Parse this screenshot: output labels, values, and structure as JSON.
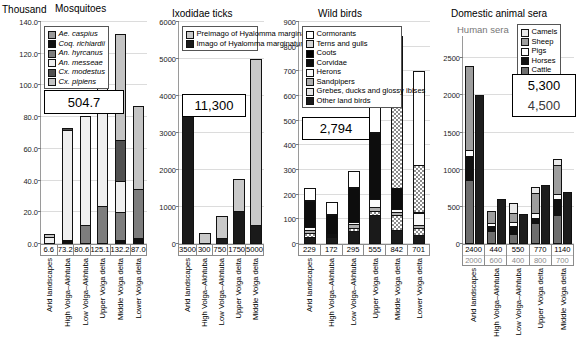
{
  "figure": {
    "panels": [
      {
        "id": "mosquitoes",
        "title": "Mosquitoes",
        "unit": "Thousand",
        "callout": "504.7",
        "legend": [
          "Ae. caspius",
          "Coq. richiardii",
          "An. hyrcanus",
          "An. messeae",
          "Cx. modestus",
          "Cx. pipiens"
        ],
        "ticks": [
          "0.0",
          "20.0",
          "40.0",
          "60.0",
          "80.0",
          "100.0",
          "120.0",
          "140.0"
        ],
        "categories": [
          "Arid landscapes",
          "High Volga–Akhtuba",
          "Low Volga–Akhtuba",
          "Upper Volga delta",
          "Middle Volga delta",
          "Lower Volga delta"
        ],
        "totals": [
          "6.6",
          "73.2",
          "80.6",
          "125.1",
          "132.2",
          "87.0"
        ]
      },
      {
        "id": "ixodidae",
        "title": "Ixodidae ticks",
        "unit": "",
        "callout": "11,300",
        "legend": [
          "Preimago of Hyalomma marginatum",
          "Imago of Hyalomma marginatum"
        ],
        "ticks": [
          "0",
          "1000",
          "2000",
          "3000",
          "4000",
          "5000",
          "6000"
        ],
        "categories": [
          "Arid landscapes",
          "High Volga–Akhtuba",
          "Low Volga–Akhtuba",
          "Upper Volga delta",
          "Middle Volga delta"
        ],
        "totals": [
          "3500",
          "300",
          "750",
          "1750",
          "5000"
        ]
      },
      {
        "id": "wild-birds",
        "title": "Wild birds",
        "unit": "",
        "callout": "2,794",
        "legend": [
          "Cormorants",
          "Terns and gulls",
          "Coots",
          "Corvidae",
          "Herons",
          "Sandpipers",
          "Grebes, ducks and glossy ibises",
          "Other land birds"
        ],
        "ticks": [
          "0",
          "100",
          "200",
          "300",
          "400",
          "500",
          "600",
          "700",
          "800",
          "900"
        ],
        "categories": [
          "Arid landscapes",
          "High Volga–Akhtuba",
          "Low Volga–Akhtuba",
          "Upper Volga delta",
          "Middle Volga delta",
          "Lower Volga delta"
        ],
        "totals": [
          "229",
          "172",
          "295",
          "555",
          "842",
          "701"
        ]
      },
      {
        "id": "domestic-animal-sera",
        "title": "Domestic animal sera",
        "unit": "",
        "human_label": "Human sera",
        "callout": "5,300",
        "callout_sub": "4,500",
        "legend": [
          "Camels",
          "Sheep",
          "Pigs",
          "Horses",
          "Cattle"
        ],
        "ticks": [
          "0",
          "500",
          "1000",
          "1500",
          "2000",
          "2500"
        ],
        "categories": [
          "Arid landscapes",
          "High Volga–Akhtuba",
          "Low Volga–Akhtuba",
          "Upper Volga delta",
          "Middle Volga delta"
        ],
        "totals": [
          "2400",
          "440",
          "550",
          "770",
          "1140"
        ],
        "totals_second": [
          "2000",
          "600",
          "400",
          "800",
          "700"
        ]
      }
    ]
  },
  "chart_data": [
    {
      "type": "bar",
      "title": "Mosquitoes",
      "ylabel": "Thousand",
      "ylim": [
        0,
        140
      ],
      "grid": true,
      "legend_position": "top-left",
      "stacked": true,
      "annotation": "504.7",
      "categories": [
        "Arid landscapes",
        "High Volga–Akhtuba",
        "Low Volga–Akhtuba",
        "Upper Volga delta",
        "Middle Volga delta",
        "Lower Volga delta"
      ],
      "totals": [
        6.6,
        73.2,
        80.6,
        125.1,
        132.2,
        87.0
      ],
      "series": [
        {
          "name": "Ae. caspius",
          "values": [
            0.0,
            0.0,
            0.0,
            0.0,
            0.0,
            0.0
          ]
        },
        {
          "name": "Coq. richiardii",
          "values": [
            0.0,
            1.2,
            0.0,
            0.0,
            1.4,
            2.8
          ]
        },
        {
          "name": "An. hyrcanus",
          "values": [
            0.0,
            0.0,
            11.0,
            23.0,
            18.0,
            31.0
          ]
        },
        {
          "name": "An. messeae",
          "values": [
            4.2,
            71.0,
            69.6,
            102.1,
            19.6,
            0.0
          ]
        },
        {
          "name": "Cx. modestus",
          "values": [
            0.0,
            1.0,
            0.0,
            0.0,
            26.0,
            0.0
          ]
        },
        {
          "name": "Cx. pipiens",
          "values": [
            2.4,
            0.0,
            0.0,
            0.0,
            67.2,
            53.2
          ]
        }
      ]
    },
    {
      "type": "bar",
      "title": "Ixodidae ticks",
      "ylabel": "",
      "ylim": [
        0,
        6000
      ],
      "grid": true,
      "legend_position": "top-left",
      "stacked": true,
      "annotation": "11,300",
      "categories": [
        "Arid landscapes",
        "High Volga–Akhtuba",
        "Low Volga–Akhtuba",
        "Upper Volga delta",
        "Middle Volga delta"
      ],
      "totals": [
        3500,
        300,
        750,
        1750,
        5000
      ],
      "series": [
        {
          "name": "Imago of Hyalomma marginatum",
          "values": [
            3450,
            0,
            130,
            870,
            460
          ]
        },
        {
          "name": "Preimago of Hyalomma marginatum",
          "values": [
            50,
            300,
            620,
            880,
            4540
          ]
        }
      ]
    },
    {
      "type": "bar",
      "title": "Wild birds",
      "ylabel": "",
      "ylim": [
        0,
        900
      ],
      "grid": true,
      "legend_position": "top-left",
      "stacked": true,
      "annotation": "2,794",
      "categories": [
        "Arid landscapes",
        "High Volga–Akhtuba",
        "Low Volga–Akhtuba",
        "Upper Volga delta",
        "Middle Volga delta",
        "Lower Volga delta"
      ],
      "totals": [
        229,
        172,
        295,
        555,
        842,
        701
      ],
      "series": [
        {
          "name": "Other land birds",
          "values": [
            22,
            20,
            46,
            112,
            50,
            28
          ]
        },
        {
          "name": "Grebes, ducks and glossy ibises",
          "values": [
            16,
            4,
            12,
            14,
            62,
            30
          ]
        },
        {
          "name": "Sandpipers",
          "values": [
            14,
            6,
            16,
            18,
            10,
            14
          ]
        },
        {
          "name": "Herons",
          "values": [
            10,
            4,
            10,
            34,
            14,
            46
          ]
        },
        {
          "name": "Corvidae",
          "values": [
            112,
            82,
            142,
            272,
            86,
            2
          ]
        },
        {
          "name": "Coots",
          "values": [
            0,
            0,
            0,
            0,
            0,
            0
          ]
        },
        {
          "name": "Terns and gulls",
          "values": [
            2,
            2,
            2,
            4,
            350,
            194
          ]
        },
        {
          "name": "Cormorants",
          "values": [
            53,
            54,
            67,
            101,
            270,
            387
          ]
        }
      ]
    },
    {
      "type": "bar",
      "title": "Domestic animal sera",
      "ylabel": "",
      "ylim": [
        0,
        2800
      ],
      "grid": true,
      "legend_position": "top-right",
      "stacked": true,
      "grouped": true,
      "annotation": "5,300",
      "annotation_sub": "4,500",
      "secondary_label": "Human sera",
      "categories": [
        "Arid landscapes",
        "High Volga–Akhtuba",
        "Low Volga–Akhtuba",
        "Upper Volga delta",
        "Middle Volga delta"
      ],
      "totals": [
        2400,
        440,
        550,
        770,
        1140
      ],
      "totals_second": [
        2000,
        600,
        400,
        800,
        700
      ],
      "series": [
        {
          "name": "Cattle",
          "values": [
            840,
            160,
            120,
            270,
            370
          ]
        },
        {
          "name": "Horses",
          "values": [
            330,
            70,
            110,
            60,
            230
          ]
        },
        {
          "name": "Pigs",
          "values": [
            80,
            40,
            60,
            80,
            60
          ]
        },
        {
          "name": "Sheep",
          "values": [
            1150,
            170,
            120,
            270,
            400
          ]
        },
        {
          "name": "Camels",
          "values": [
            0,
            0,
            140,
            90,
            80
          ]
        }
      ],
      "series_second": [
        {
          "name": "Human sera",
          "values": [
            2000,
            600,
            400,
            800,
            700
          ]
        }
      ]
    }
  ]
}
